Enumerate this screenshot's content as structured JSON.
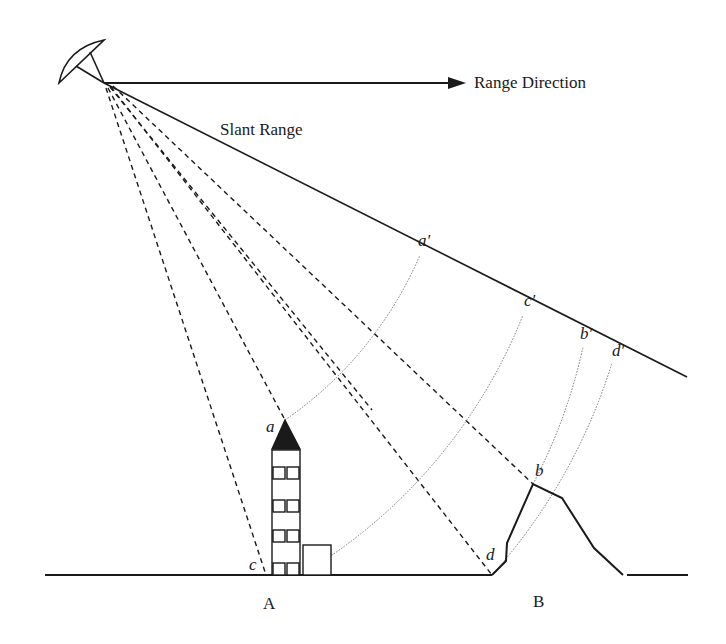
{
  "labels": {
    "range_direction": "Range Direction",
    "slant_range": "Slant Range",
    "ground_A": "A",
    "ground_B": "B",
    "point_a": "a",
    "point_b": "b",
    "point_c": "c",
    "point_d": "d",
    "point_a_prime": "a′",
    "point_b_prime": "b′",
    "point_c_prime": "c′",
    "point_d_prime": "d′"
  },
  "diagram": {
    "type": "radar-slant-range-geometry",
    "colors": {
      "line": "#1a1a1a",
      "dotted": "#777777",
      "background": "#ffffff"
    },
    "antenna_origin": [
      104,
      83
    ],
    "slant_range_end": [
      687,
      377
    ],
    "range_arrow_end": [
      463,
      83
    ],
    "ground_y": 575,
    "ground_points": {
      "a": [
        285,
        420
      ],
      "c": [
        266,
        575
      ],
      "b": [
        533,
        484
      ],
      "d": [
        492,
        575
      ]
    },
    "slant_points": {
      "a_prime": [
        420,
        255
      ],
      "c_prime": [
        523,
        315
      ],
      "b_prime": [
        583,
        347
      ],
      "d_prime": [
        612,
        363
      ]
    },
    "objects": [
      {
        "name": "building-tower",
        "label": "A"
      },
      {
        "name": "mountain",
        "label": "B"
      }
    ]
  }
}
